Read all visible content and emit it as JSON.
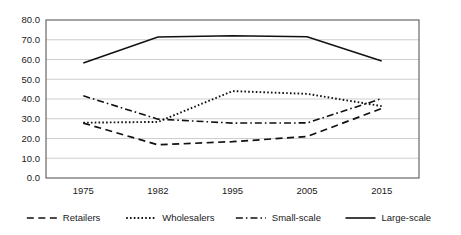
{
  "chart_data": {
    "type": "line",
    "title": "",
    "subtitle": "",
    "xlabel": "",
    "ylabel": "",
    "categories": [
      "1975",
      "1982",
      "1995",
      "2005",
      "2015"
    ],
    "series": [
      {
        "name": "Retailers",
        "style": "dashed",
        "values": [
          27.8,
          16.8,
          18.4,
          21.0,
          35.2
        ]
      },
      {
        "name": "Wholesalers",
        "style": "dotted",
        "values": [
          28.0,
          28.4,
          44.0,
          42.6,
          36.4
        ]
      },
      {
        "name": "Small-scale",
        "style": "dashdot",
        "values": [
          41.6,
          29.8,
          27.8,
          27.9,
          40.2
        ]
      },
      {
        "name": "Large-scale",
        "style": "solid",
        "values": [
          58.2,
          71.4,
          72.0,
          71.5,
          59.2
        ]
      }
    ],
    "ylim": [
      0.0,
      80.0
    ],
    "ytick_step": 10.0,
    "ytick_labels": [
      "0.0",
      "10.0",
      "20.0",
      "30.0",
      "40.0",
      "50.0",
      "60.0",
      "70.0",
      "80.0"
    ],
    "grid": true,
    "grid_axis": "y",
    "legend_position": "bottom",
    "legend_entries": [
      "Retailers",
      "Wholesalers",
      "Small-scale",
      "Large-scale"
    ],
    "line_color": "#111111",
    "grid_color": "#b9b9b9",
    "border_color": "#5a5a5a",
    "background_color": "#ffffff"
  }
}
